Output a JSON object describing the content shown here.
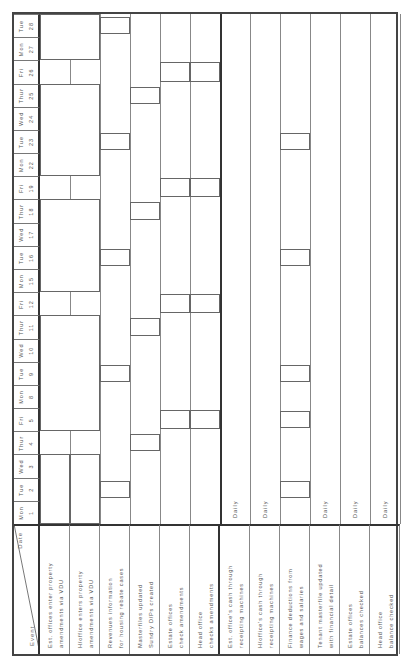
{
  "header": {
    "date_label": "Date",
    "event_label": "Event"
  },
  "dates": [
    {
      "day": "Mon",
      "num": "1"
    },
    {
      "day": "Tue",
      "num": "2"
    },
    {
      "day": "Wed",
      "num": "3"
    },
    {
      "day": "Thur",
      "num": "4"
    },
    {
      "day": "Fri",
      "num": "5"
    },
    {
      "day": "Mon",
      "num": "8"
    },
    {
      "day": "Tue",
      "num": "9"
    },
    {
      "day": "Wed",
      "num": "10"
    },
    {
      "day": "Thur",
      "num": "11"
    },
    {
      "day": "Fri",
      "num": "12"
    },
    {
      "day": "Mon",
      "num": "15"
    },
    {
      "day": "Tue",
      "num": "16"
    },
    {
      "day": "Wed",
      "num": "17"
    },
    {
      "day": "Thur",
      "num": "18"
    },
    {
      "day": "Fri",
      "num": "19"
    },
    {
      "day": "Mon",
      "num": "22"
    },
    {
      "day": "Tue",
      "num": "23"
    },
    {
      "day": "Wed",
      "num": "24"
    },
    {
      "day": "Thur",
      "num": "25"
    },
    {
      "day": "Fri",
      "num": "26"
    },
    {
      "day": "Mon",
      "num": "27"
    },
    {
      "day": "Tue",
      "num": "28"
    }
  ],
  "events": [
    {
      "line1": "Est. offices enter property",
      "line2": "amendments via VDU"
    },
    {
      "line1": "H/office enters property",
      "line2": "amendments via VDU"
    },
    {
      "line1": "Revenues information",
      "line2": "for housing rebate cases"
    },
    {
      "line1": "Masterfiles updated",
      "line2": "Sundry D/Ps created"
    },
    {
      "line1": "Estate offices",
      "line2": "check amendments"
    },
    {
      "line1": "Head office",
      "line2": "checks amendments"
    },
    {
      "line1": "Est. office's cash through",
      "line2": "receipting machines"
    },
    {
      "line1": "H/office's cash through",
      "line2": "receipting machines"
    },
    {
      "line1": "Finance deductions from",
      "line2": "wages and salaries"
    },
    {
      "line1": "Tenant masterfile updated",
      "line2": "with financial detail"
    },
    {
      "line1": "Estate offices",
      "line2": "balances checked"
    },
    {
      "line1": "Head office",
      "line2": "balance checked"
    }
  ],
  "daily_label": "Daily",
  "daily_rows": [
    6,
    7,
    9,
    10,
    11
  ]
}
